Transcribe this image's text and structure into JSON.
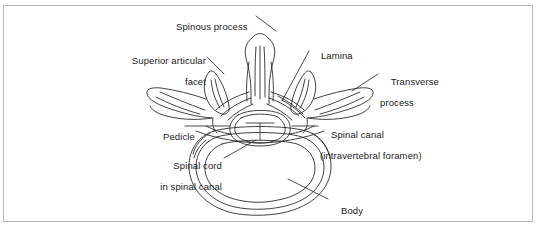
{
  "figure": {
    "type": "anatomical-line-drawing",
    "background_color": "#ffffff",
    "border_color": "#b9b9b9",
    "line_color": "#2b2b2b",
    "labels": [
      {
        "id": "spinous-process",
        "line1": "Spinous process",
        "line2": "",
        "align": "left"
      },
      {
        "id": "superior-articular-facet",
        "line1": "Superior articular",
        "line2": "facet",
        "align": "right"
      },
      {
        "id": "lamina",
        "line1": "Lamina",
        "line2": "",
        "align": "left"
      },
      {
        "id": "transverse-process",
        "line1": "Transverse",
        "line2": "process",
        "align": "left"
      },
      {
        "id": "pedicle",
        "line1": "Pedicle",
        "line2": "",
        "align": "left"
      },
      {
        "id": "spinal-canal",
        "line1": "Spinal canal",
        "line2": "(intravertebral foramen)",
        "align": "left"
      },
      {
        "id": "spinal-cord-in-spinal-canal",
        "line1": "Spinal cord",
        "line2": "in spinal canal",
        "align": "right"
      },
      {
        "id": "body",
        "line1": "Body",
        "line2": "",
        "align": "left"
      }
    ]
  }
}
